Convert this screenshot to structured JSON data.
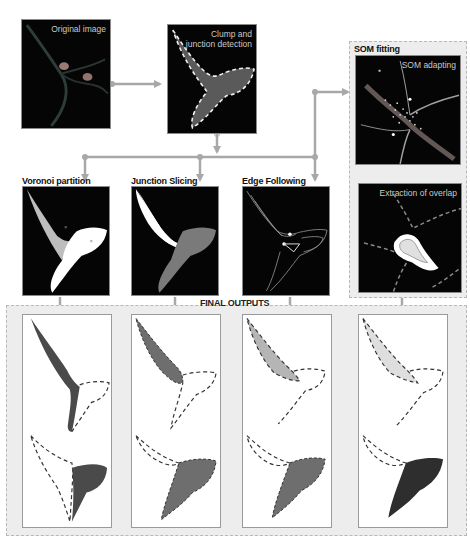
{
  "figure": {
    "top_cropped_caption": "…(caption cut off at top edge)…",
    "colors": {
      "panel_bg": "#050505",
      "arrow": "#a8a8a8",
      "group_bg": "#ededed",
      "group_border": "#b8b8b8",
      "clump_fill": "#5a5a5a",
      "dashed_outline": "#f0f0f0",
      "region_light": "#bdbdbd",
      "region_white": "#ffffff",
      "region_mid": "#7a7a7a",
      "output_dark": "#4a4a4a",
      "output_mid": "#6e6e6e",
      "output_light": "#b5b5b5",
      "output_pale": "#dedede",
      "output_darkest": "#2e2e2e"
    }
  },
  "stages": {
    "original": {
      "label": "Original image"
    },
    "clump": {
      "label": "Clump and\njunction detection"
    },
    "voronoi": {
      "label": "Voronoi partition"
    },
    "junction": {
      "label": "Junction Slicing"
    },
    "edge": {
      "label": "Edge Following"
    },
    "som_group": {
      "label": "SOM fitting"
    },
    "som_adapting": {
      "label": "SOM adapting"
    },
    "overlap": {
      "label": "Extraction of overlap"
    }
  },
  "final_outputs": {
    "label": "FINAL OUTPUTS",
    "columns": [
      {
        "method": "Voronoi partition",
        "top_fill": "dark",
        "bottom_fill": "dark"
      },
      {
        "method": "Junction Slicing",
        "top_fill": "mid",
        "bottom_fill": "mid"
      },
      {
        "method": "Edge Following",
        "top_fill": "light",
        "bottom_fill": "mid"
      },
      {
        "method": "SOM fitting",
        "top_fill": "pale",
        "bottom_fill": "darkest"
      }
    ]
  }
}
